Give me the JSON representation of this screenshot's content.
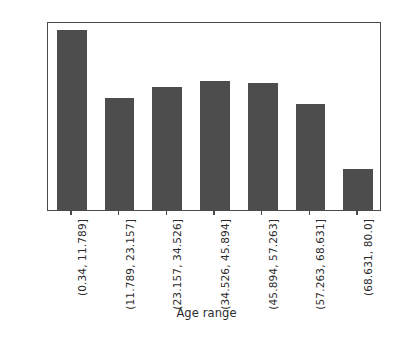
{
  "chart_data": {
    "type": "bar",
    "title": "",
    "subtitle": "",
    "xlabel": "Age range",
    "ylabel": "",
    "categories": [
      "(0.34, 11.789]",
      "(11.789, 23.157]",
      "(23.157, 34.526]",
      "(34.526, 45.894]",
      "(45.894, 57.263]",
      "(57.263, 68.631]",
      "(68.631, 80.0]"
    ],
    "values": [
      0.57,
      0.355,
      0.392,
      0.41,
      0.402,
      0.335,
      0.13
    ],
    "ylim": [
      0.0,
      0.6
    ],
    "xlim": [
      0,
      7
    ],
    "ytick_labels": [
      "0.0",
      "0.1",
      "0.2",
      "0.3",
      "0.4",
      "0.5",
      "0.6"
    ],
    "ytick_values": [
      0.0,
      0.1,
      0.2,
      0.3,
      0.4,
      0.5,
      0.6
    ],
    "grid": false,
    "legend": false,
    "legend_position": "none",
    "bar_color": "#4d4d4d",
    "axis_color": "#4a4a4a",
    "background_color": "#ffffff",
    "tick_label_rotation": 90,
    "bar_width_fraction": 0.62
  },
  "axes": {
    "x_title": "Age range"
  }
}
